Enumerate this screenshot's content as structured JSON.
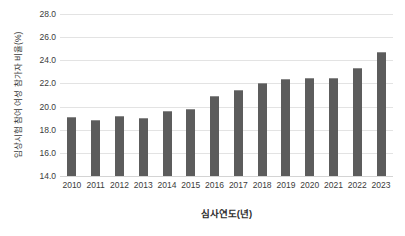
{
  "chart_data": {
    "type": "bar",
    "title": "",
    "xlabel": "심사연도(년)",
    "ylabel": "임상시험 참여 여성 참가자 비율(%)",
    "categories": [
      "2010",
      "2011",
      "2012",
      "2013",
      "2014",
      "2015",
      "2016",
      "2017",
      "2018",
      "2019",
      "2020",
      "2021",
      "2022",
      "2023"
    ],
    "values": [
      19.1,
      18.8,
      19.2,
      19.0,
      19.6,
      19.8,
      20.9,
      21.4,
      22.0,
      22.4,
      22.5,
      22.5,
      23.3,
      24.7
    ],
    "ylim": [
      14.0,
      28.0
    ],
    "ytick_labels": [
      "28.0",
      "26.0",
      "24.0",
      "22.0",
      "20.0",
      "18.0",
      "16.0",
      "14.0"
    ],
    "ytick_values": [
      28.0,
      26.0,
      24.0,
      22.0,
      20.0,
      18.0,
      16.0,
      14.0
    ],
    "grid": true,
    "legend": "none",
    "bar_color": "#5c5c5c",
    "grid_color": "#e3e3e3",
    "background_color": "#ffffff"
  }
}
